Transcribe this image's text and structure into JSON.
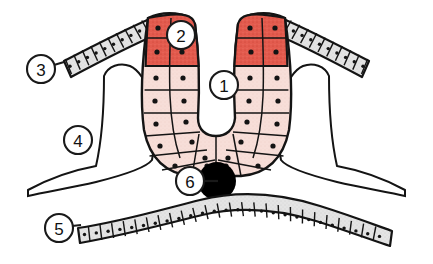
{
  "figure": {
    "background_color": "#ffffff",
    "width": 433,
    "height": 264,
    "colors": {
      "outline": "#141414",
      "stained_cells": "#e35b4e",
      "stained_cells_light": "#ef7b6d",
      "pale_cells": "#f7ded8",
      "connective_tissue": "#e2e2e2",
      "connective_tissue_border": "#141414",
      "nucleus": "#141414",
      "lumen": "#ffffff",
      "label_circle_fill": "#ffffff",
      "label_text": "#111111"
    }
  },
  "labels": [
    {
      "id": "label-1",
      "number": "1",
      "cx": 224,
      "cy": 85,
      "r": 14,
      "leader": null,
      "describes": "central-lumen"
    },
    {
      "id": "label-2",
      "number": "2",
      "cx": 181,
      "cy": 35,
      "r": 14,
      "leader": null,
      "describes": "stained-apical-cells"
    },
    {
      "id": "label-3",
      "number": "3",
      "cx": 41,
      "cy": 69,
      "r": 14,
      "leader": {
        "x1": 54,
        "y1": 65,
        "x2": 63,
        "y2": 62
      },
      "describes": "surface-epithelium-left"
    },
    {
      "id": "label-4",
      "number": "4",
      "cx": 78,
      "cy": 140,
      "r": 14,
      "leader": null,
      "describes": "connective-tissue-left"
    },
    {
      "id": "label-5",
      "number": "5",
      "cx": 59,
      "cy": 228,
      "r": 14,
      "leader": {
        "x1": 72,
        "y1": 226,
        "x2": 80,
        "y2": 225
      },
      "describes": "basal-epithelium"
    },
    {
      "id": "label-6",
      "number": "6",
      "cx": 190,
      "cy": 181,
      "r": 14,
      "leader": {
        "x1": 204,
        "y1": 181,
        "x2": 217,
        "y2": 181
      },
      "describes": "dark-granule-body"
    }
  ],
  "regions": [
    {
      "id": "central-lumen",
      "name": "central lumen",
      "fill": "#ffffff"
    },
    {
      "id": "stained-apical-cells",
      "name": "stained apical cells",
      "fill": "#e35b4e"
    },
    {
      "id": "surface-epithelium-left",
      "name": "left surface epithelium",
      "fill": "#e2e2e2"
    },
    {
      "id": "surface-epithelium-right",
      "name": "right surface epithelium",
      "fill": "#e2e2e2"
    },
    {
      "id": "connective-tissue-left",
      "name": "left connective tissue",
      "fill": "#e2e2e2"
    },
    {
      "id": "connective-tissue-right",
      "name": "right connective tissue",
      "fill": "#e2e2e2"
    },
    {
      "id": "basal-epithelium",
      "name": "basal epithelium layer",
      "fill": "#e2e2e2"
    },
    {
      "id": "dark-granule-body",
      "name": "dark granule body",
      "fill": "#000000"
    },
    {
      "id": "gland-wall-cells",
      "name": "pale gland wall cells",
      "fill": "#f7ded8"
    }
  ]
}
